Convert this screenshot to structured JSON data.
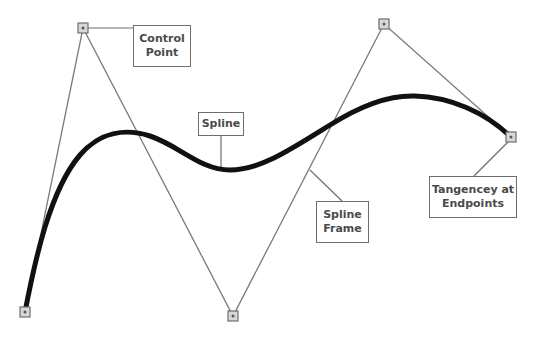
{
  "diagram": {
    "type": "spline-anatomy",
    "colors": {
      "background": "#ffffff",
      "spline": "#111111",
      "frame": "#7a7a7a",
      "control_point_fill": "#d8d8d8",
      "control_point_stroke": "#6e6e6e",
      "label_border": "#6e6e6e",
      "label_text": "#4a4a4a"
    },
    "control_points": [
      {
        "id": "p0",
        "x": 25,
        "y": 312
      },
      {
        "id": "p1",
        "x": 83,
        "y": 28
      },
      {
        "id": "p2",
        "x": 233,
        "y": 316
      },
      {
        "id": "p3",
        "x": 384,
        "y": 24
      },
      {
        "id": "p4",
        "x": 511,
        "y": 137
      }
    ],
    "labels": {
      "control_point": {
        "line1": "Control",
        "line2": "Point"
      },
      "spline": {
        "line1": "Spline"
      },
      "spline_frame": {
        "line1": "Spline",
        "line2": "Frame"
      },
      "tangency": {
        "line1": "Tangencey at",
        "line2": "Endpoints"
      }
    }
  }
}
